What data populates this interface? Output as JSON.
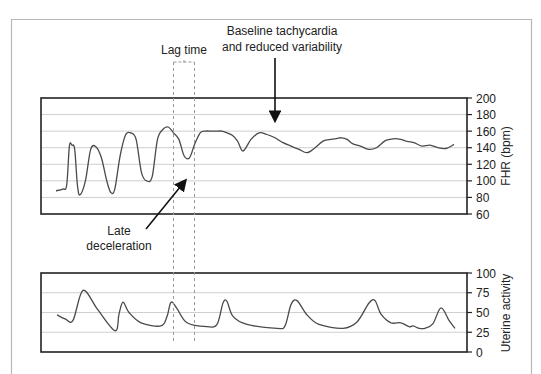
{
  "colors": {
    "frame": "#b8b8b8",
    "axis": "#222222",
    "grid": "#cfcfcf",
    "trace": "#4a4a4a",
    "dashed": "#9a9a9a",
    "annotation": "#111111"
  },
  "annotations": {
    "lag_time": "Lag time",
    "baseline_line1": "Baseline tachycardia",
    "baseline_line2": "and reduced variability",
    "late_line1": "Late",
    "late_line2": "deceleration"
  },
  "chart_data": [
    {
      "type": "line",
      "title": "Fetal heart rate",
      "ylabel": "FHR (bpm)",
      "xlabel": "",
      "ylim": [
        60,
        200
      ],
      "yticks": [
        200,
        180,
        160,
        140,
        120,
        100,
        80,
        60
      ],
      "grid": true,
      "axis_side": "right",
      "series": [
        {
          "name": "FHR",
          "x": [
            0,
            5,
            8,
            10,
            12,
            14,
            16,
            18,
            22,
            26,
            30,
            34,
            38,
            41,
            44,
            48,
            52,
            56,
            60,
            64,
            68,
            72,
            76,
            80,
            84,
            88,
            92,
            96,
            100,
            104,
            108,
            112,
            116,
            120,
            124,
            128,
            132,
            136,
            140,
            146,
            152,
            158,
            164,
            170,
            176,
            182,
            188,
            194,
            200,
            206,
            210,
            214,
            218,
            222,
            228,
            234,
            240,
            246,
            250,
            254,
            258,
            262,
            268,
            274,
            280,
            286,
            292,
            298
          ],
          "values": [
            88,
            90,
            95,
            142,
            143,
            138,
            95,
            83,
            100,
            138,
            141,
            128,
            100,
            86,
            90,
            130,
            155,
            158,
            150,
            110,
            100,
            105,
            150,
            162,
            165,
            158,
            150,
            130,
            128,
            145,
            158,
            160,
            160,
            160,
            160,
            158,
            155,
            148,
            136,
            150,
            158,
            156,
            152,
            146,
            142,
            138,
            134,
            140,
            148,
            150,
            151,
            152,
            150,
            145,
            142,
            138,
            140,
            148,
            150,
            151,
            150,
            148,
            146,
            142,
            143,
            140,
            139,
            144
          ]
        }
      ]
    },
    {
      "type": "line",
      "title": "Uterine activity",
      "ylabel": "Uterine activity",
      "xlabel": "",
      "ylim": [
        0,
        100
      ],
      "yticks": [
        100,
        75,
        50,
        25,
        0
      ],
      "grid": true,
      "axis_side": "right",
      "series": [
        {
          "name": "Uterine activity",
          "x": [
            0,
            8,
            16,
            26,
            40,
            58,
            62,
            66,
            72,
            84,
            104,
            110,
            114,
            120,
            130,
            150,
            160,
            166,
            170,
            176,
            190,
            220,
            228,
            234,
            240,
            250,
            262,
            286,
            300,
            312,
            318,
            324,
            334,
            344,
            352,
            356,
            362,
            368,
            376,
            384,
            392,
            398
          ],
          "values": [
            47,
            42,
            40,
            78,
            55,
            27,
            48,
            63,
            50,
            37,
            33,
            45,
            63,
            55,
            37,
            32,
            35,
            62,
            64,
            45,
            35,
            30,
            33,
            60,
            65,
            47,
            35,
            30,
            38,
            62,
            65,
            48,
            37,
            37,
            32,
            33,
            30,
            30,
            36,
            56,
            40,
            30
          ]
        }
      ]
    }
  ]
}
